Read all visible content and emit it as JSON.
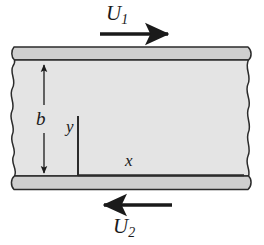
{
  "figure": {
    "type": "fluid-mechanics-schematic",
    "labels": {
      "upper_velocity": {
        "symbol": "U",
        "subscript": "1",
        "text": "U1",
        "description": "velocity of upper plate, directed to the right"
      },
      "lower_velocity": {
        "symbol": "U",
        "subscript": "2",
        "text": "U2",
        "description": "velocity of lower plate, directed to the left"
      },
      "gap": {
        "text": "b",
        "description": "channel height between plates"
      },
      "axis_y": {
        "text": "y",
        "description": "vertical coordinate axis"
      },
      "axis_x": {
        "text": "x",
        "description": "horizontal coordinate axis along lower plate"
      }
    },
    "arrows": {
      "upper": {
        "direction": "right",
        "x_start": 100,
        "x_end": 172,
        "y": 34
      },
      "lower": {
        "direction": "left",
        "x_start": 172,
        "x_end": 100,
        "y": 205
      },
      "dimension": {
        "direction": "both",
        "x": 44,
        "y_top": 62,
        "y_bottom": 176
      }
    },
    "geometry": {
      "channel_top": 60,
      "channel_bottom": 176,
      "plate_thickness": 13,
      "origin_x": 78,
      "y_axis_top": 116
    },
    "colors": {
      "fluid_fill": "#e4e4e4",
      "plate_fill": "#cfcfcf",
      "outline": "#2b2b2b",
      "arrow": "#1a1a1a",
      "background": "#ffffff"
    }
  }
}
